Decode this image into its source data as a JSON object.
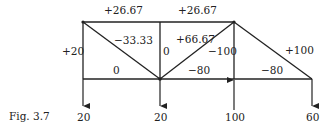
{
  "figure": {
    "caption": "Fig. 3.7",
    "nodes": {
      "TL": [
        83,
        22
      ],
      "TM": [
        160,
        22
      ],
      "TR": [
        234,
        22
      ],
      "BL": [
        83,
        79
      ],
      "BM": [
        160,
        79
      ],
      "BR1": [
        234,
        79
      ],
      "BR2": [
        312,
        79
      ]
    },
    "members": [
      {
        "id": "top-left",
        "from": "TL",
        "to": "TM",
        "force": "+26.67"
      },
      {
        "id": "top-right",
        "from": "TM",
        "to": "TR",
        "force": "+26.67"
      },
      {
        "id": "left-vertical",
        "from": "TL",
        "to": "BL",
        "force": "+20"
      },
      {
        "id": "left-diagonal",
        "from": "TL",
        "to": "BM",
        "force": "−33.33"
      },
      {
        "id": "middle-vertical",
        "from": "TM",
        "to": "BM",
        "force": "0"
      },
      {
        "id": "center-diagonal",
        "from": "BM",
        "to": "TR",
        "force": "+66.67"
      },
      {
        "id": "right-vertical",
        "from": "TR",
        "to": "BR1",
        "force": "−100"
      },
      {
        "id": "right-diagonal",
        "from": "TR",
        "to": "BR2",
        "force": "+100"
      },
      {
        "id": "bottom-1",
        "from": "BL",
        "to": "BM",
        "force": "0"
      },
      {
        "id": "bottom-2",
        "from": "BM",
        "to": "BR1",
        "force": "−80"
      },
      {
        "id": "bottom-3",
        "from": "BR1",
        "to": "BR2",
        "force": "−80"
      }
    ],
    "loads": [
      {
        "node": "BL",
        "direction": "down",
        "value": "20"
      },
      {
        "node": "BM",
        "direction": "down",
        "value": "20"
      },
      {
        "node": "BR1",
        "direction": "up",
        "value": "100"
      },
      {
        "node": "BR2",
        "direction": "down",
        "value": "60"
      }
    ]
  }
}
